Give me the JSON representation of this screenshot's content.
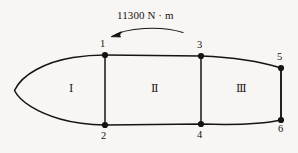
{
  "figure": {
    "title_annotation": "11300 N · m",
    "background_color": "#f7f6f4",
    "line_color": "#17140f",
    "moment_arrow": {
      "name": "applied-moment",
      "direction": "counterclockwise",
      "magnitude_text": "11300 N · m"
    },
    "nodes": [
      {
        "id": "1",
        "label": "1",
        "x": 105,
        "y": 55,
        "label_x": 100,
        "label_y": 39
      },
      {
        "id": "2",
        "label": "2",
        "x": 105,
        "y": 125,
        "label_x": 101,
        "label_y": 131
      },
      {
        "id": "3",
        "label": "3",
        "x": 201,
        "y": 56,
        "label_x": 197,
        "label_y": 40
      },
      {
        "id": "4",
        "label": "4",
        "x": 201,
        "y": 124,
        "label_x": 197,
        "label_y": 130
      },
      {
        "id": "5",
        "label": "5",
        "x": 281,
        "y": 68,
        "label_x": 277,
        "label_y": 52
      },
      {
        "id": "6",
        "label": "6",
        "x": 281,
        "y": 120,
        "label_x": 278,
        "label_y": 124
      }
    ],
    "regions": [
      {
        "id": "I",
        "label": "Ⅰ",
        "x": 72,
        "y": 83
      },
      {
        "id": "II",
        "label": "Ⅱ",
        "x": 154,
        "y": 83
      },
      {
        "id": "III",
        "label": "Ⅲ",
        "x": 239,
        "y": 83
      }
    ],
    "members": [
      {
        "name": "member-1-2",
        "from": "1",
        "to": "2"
      },
      {
        "name": "member-3-4",
        "from": "3",
        "to": "4"
      },
      {
        "name": "member-5-6",
        "from": "5",
        "to": "6"
      }
    ],
    "outline": {
      "name": "airfoil-outline",
      "description": "closed tapered lens / airfoil profile"
    }
  }
}
